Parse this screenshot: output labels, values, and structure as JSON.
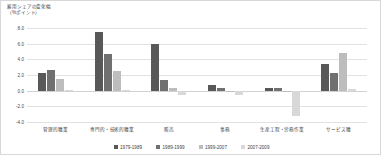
{
  "axis_title": "雇用シェアの変化幅\n（%ポイント）",
  "colors": {
    "series_1": "#585858",
    "series_2": "#707070",
    "series_3": "#bdbdbd",
    "series_4": "#d8d8d8",
    "gridline": "#e2e2e2",
    "text": "#3f3f3f",
    "border": "#d8d8d8"
  },
  "chart_data": {
    "type": "bar",
    "xlabel": "",
    "ylabel": "雇用シェアの変化幅（%ポイント）",
    "ylim": [
      -4.0,
      8.0
    ],
    "yticks": [
      8.0,
      6.0,
      4.0,
      2.0,
      0.0,
      -2.0,
      -4.0
    ],
    "ytick_labels": [
      "8.0",
      "6.0",
      "4.0",
      "2.0",
      "0.0",
      "-2.0",
      "-4.0"
    ],
    "grid": true,
    "legend_position": "bottom",
    "categories": [
      "管理的職業",
      "専門的・技術的職業",
      "販売",
      "事務",
      "生産工程・労務作業",
      "サービス職"
    ],
    "series": [
      {
        "name": "1979-1989",
        "values": [
          2.2,
          7.5,
          5.9,
          0.7,
          0.3,
          3.4
        ]
      },
      {
        "name": "1989-1999",
        "values": [
          2.7,
          4.7,
          1.3,
          0.3,
          0.35,
          2.3
        ]
      },
      {
        "name": "1999-2007",
        "values": [
          1.5,
          2.5,
          0.3,
          0.0,
          -0.15,
          4.8
        ]
      },
      {
        "name": "2007-2009",
        "values": [
          0.05,
          0.1,
          -0.5,
          -0.6,
          -3.2,
          0.2
        ]
      }
    ]
  }
}
